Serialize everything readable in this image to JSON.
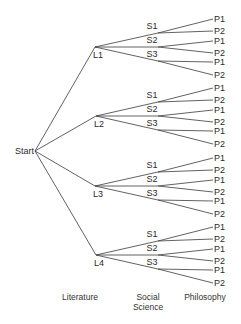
{
  "diagram": {
    "type": "tree",
    "root": {
      "label": "Start",
      "x": 35,
      "y": 151
    },
    "levels": [
      {
        "name": "Literature",
        "nodes": [
          "L1",
          "L2",
          "L3",
          "L4"
        ]
      },
      {
        "name": "Social Science",
        "nodes": [
          "S1",
          "S2",
          "S3"
        ]
      },
      {
        "name": "Philosophy",
        "nodes": [
          "P1",
          "P2"
        ]
      }
    ],
    "literature_nodes": [
      {
        "label": "L1",
        "x": 95,
        "y": 47
      },
      {
        "label": "L2",
        "x": 96,
        "y": 116
      },
      {
        "label": "L3",
        "x": 95,
        "y": 186
      },
      {
        "label": "L4",
        "x": 96,
        "y": 255
      }
    ],
    "social_science_nodes": [
      {
        "label": "S1",
        "dy": -14
      },
      {
        "label": "S2",
        "dy": 0
      },
      {
        "label": "S3",
        "dy": 14
      }
    ],
    "philosophy_leaves": [
      {
        "label": "P1",
        "parent": 0,
        "dy": -28
      },
      {
        "label": "P2",
        "parent": 0,
        "dy": -16
      },
      {
        "label": "P1",
        "parent": 1,
        "dy": -6
      },
      {
        "label": "P2",
        "parent": 1,
        "dy": 6
      },
      {
        "label": "P1",
        "parent": 2,
        "dy": 15
      },
      {
        "label": "P2",
        "parent": 2,
        "dy": 28
      }
    ],
    "s_junction_x": 158,
    "p_end_x": 213
  },
  "axis_labels": {
    "literature": "Literature",
    "social_science_line1": "Social",
    "social_science_line2": "Science",
    "philosophy": "Philosophy"
  }
}
